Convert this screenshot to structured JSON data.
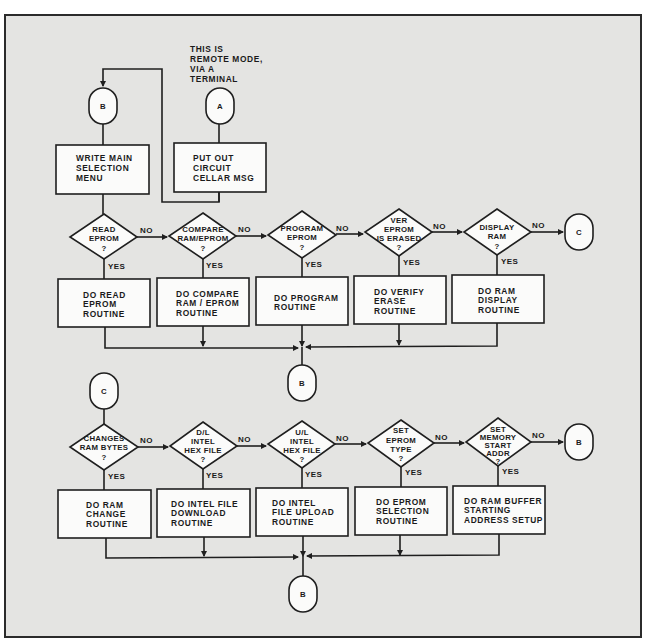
{
  "diagram": {
    "note": [
      "THIS IS",
      "REMOTE MODE,",
      "VIA A",
      "TERMINAL"
    ],
    "connectors": {
      "entry_b": "B",
      "entry_a": "A",
      "exit_c": "C",
      "row1_return_b": "B",
      "entry_c": "C",
      "row2_exit_b": "B",
      "row2_return_b": "B"
    },
    "init_boxes": {
      "main_menu": [
        "WRITE MAIN",
        "SELECTION",
        "MENU"
      ],
      "circuit_msg": [
        "PUT OUT",
        "CIRCUIT",
        "CELLAR MSG"
      ]
    },
    "branch_labels": {
      "no": "NO",
      "yes": "YES"
    },
    "row1": [
      {
        "decision": [
          "READ",
          "EPROM",
          "?"
        ],
        "action": [
          "DO READ",
          "EPROM",
          "ROUTINE"
        ]
      },
      {
        "decision": [
          "COMPARE",
          "RAM/EPROM",
          "?"
        ],
        "action": [
          "DO COMPARE",
          "RAM / EPROM",
          "ROUTINE"
        ]
      },
      {
        "decision": [
          "PROGRAM",
          "EPROM",
          "?"
        ],
        "action": [
          "DO PROGRAM",
          "ROUTINE"
        ]
      },
      {
        "decision": [
          "VER",
          "EPROM",
          "IS ERASED",
          "?"
        ],
        "action": [
          "DO VERIFY",
          "ERASE",
          "ROUTINE"
        ]
      },
      {
        "decision": [
          "DISPLAY",
          "RAM",
          "?"
        ],
        "action": [
          "DO RAM",
          "DISPLAY",
          "ROUTINE"
        ]
      }
    ],
    "row2": [
      {
        "decision": [
          "CHANGES",
          "RAM BYTES",
          "?"
        ],
        "action": [
          "DO RAM",
          "CHANGE",
          "ROUTINE"
        ]
      },
      {
        "decision": [
          "D/L",
          "INTEL",
          "HEX FILE",
          "?"
        ],
        "action": [
          "DO INTEL FILE",
          "DOWNLOAD",
          "ROUTINE"
        ]
      },
      {
        "decision": [
          "U/L",
          "INTEL",
          "HEX FILE",
          "?"
        ],
        "action": [
          "DO INTEL",
          "FILE UPLOAD",
          "ROUTINE"
        ]
      },
      {
        "decision": [
          "SET",
          "EPROM",
          "TYPE",
          "?"
        ],
        "action": [
          "DO EPROM",
          "SELECTION",
          "ROUTINE"
        ]
      },
      {
        "decision": [
          "SET",
          "MEMORY",
          "START",
          "ADDR",
          "?"
        ],
        "action": [
          "DO RAM BUFFER",
          "STARTING",
          "ADDRESS SETUP"
        ]
      }
    ]
  }
}
